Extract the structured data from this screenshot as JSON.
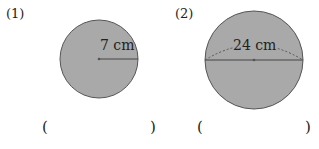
{
  "problems": [
    {
      "number": "(1)",
      "measure_label": "7 cm",
      "measure_type": "radius",
      "answer_open": "(",
      "answer_close": ")"
    },
    {
      "number": "(2)",
      "measure_label": "24 cm",
      "measure_type": "diameter",
      "answer_open": "(",
      "answer_close": ")"
    }
  ],
  "colors": {
    "circle_fill": "#a9a9a9",
    "circle_stroke": "#555555",
    "text": "#222222"
  }
}
